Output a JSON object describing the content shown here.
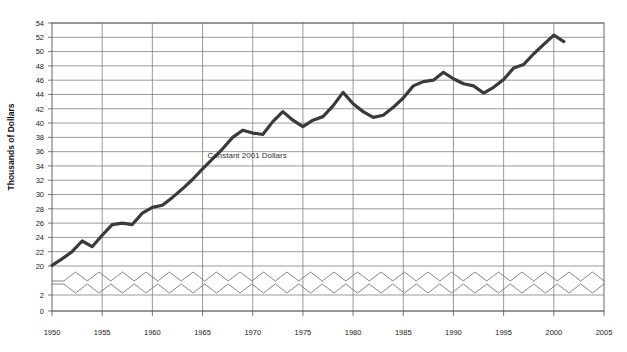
{
  "chart_data": {
    "type": "line",
    "title": "",
    "annotation": "Constant 2001 Dollars",
    "ylabel": "Thousands of Dollars",
    "xlabel": "",
    "xlim": [
      1950,
      2005
    ],
    "ylim": [
      0,
      54
    ],
    "grid": true,
    "legend": null,
    "axis_break": {
      "present": true,
      "between": [
        2,
        20
      ],
      "style": "double-zigzag"
    },
    "ytick_labels": [
      "0",
      "2",
      "20",
      "22",
      "24",
      "26",
      "28",
      "30",
      "32",
      "34",
      "36",
      "38",
      "40",
      "42",
      "44",
      "46",
      "48",
      "50",
      "52",
      "54"
    ],
    "ytick_values": [
      0,
      2,
      20,
      22,
      24,
      26,
      28,
      30,
      32,
      34,
      36,
      38,
      40,
      42,
      44,
      46,
      48,
      50,
      52,
      54
    ],
    "xtick_labels": [
      "1950",
      "1955",
      "1960",
      "1965",
      "1970",
      "1975",
      "1980",
      "1985",
      "1990",
      "1995",
      "2000",
      "2005"
    ],
    "xtick_values": [
      1950,
      1955,
      1960,
      1965,
      1970,
      1975,
      1980,
      1985,
      1990,
      1995,
      2000,
      2005
    ],
    "series": [
      {
        "name": "Constant 2001 Dollars",
        "color": "#3a3a3a",
        "x": [
          1950,
          1951,
          1952,
          1953,
          1954,
          1955,
          1956,
          1957,
          1958,
          1959,
          1960,
          1961,
          1962,
          1963,
          1964,
          1965,
          1966,
          1967,
          1968,
          1969,
          1970,
          1971,
          1972,
          1973,
          1974,
          1975,
          1976,
          1977,
          1978,
          1979,
          1980,
          1981,
          1982,
          1983,
          1984,
          1985,
          1986,
          1987,
          1988,
          1989,
          1990,
          1991,
          1992,
          1993,
          1994,
          1995,
          1996,
          1997,
          1998,
          1999,
          2000,
          2001
        ],
        "values": [
          20.1,
          21.0,
          22.0,
          23.5,
          22.7,
          24.3,
          25.8,
          26.0,
          25.8,
          27.4,
          28.2,
          28.5,
          29.6,
          30.8,
          32.1,
          33.6,
          35.0,
          36.4,
          38.0,
          39.0,
          38.6,
          38.4,
          40.2,
          41.6,
          40.4,
          39.5,
          40.4,
          40.9,
          42.4,
          44.3,
          42.7,
          41.6,
          40.8,
          41.1,
          42.2,
          43.5,
          45.2,
          45.8,
          46.0,
          47.1,
          46.2,
          45.5,
          45.2,
          44.2,
          45.0,
          46.1,
          47.7,
          48.2,
          49.7,
          51.0,
          52.3,
          51.4
        ]
      }
    ]
  },
  "axis_titles": {
    "y": "Thousands of Dollars"
  },
  "annotations": {
    "constant_dollars": "Constant 2001 Dollars"
  }
}
